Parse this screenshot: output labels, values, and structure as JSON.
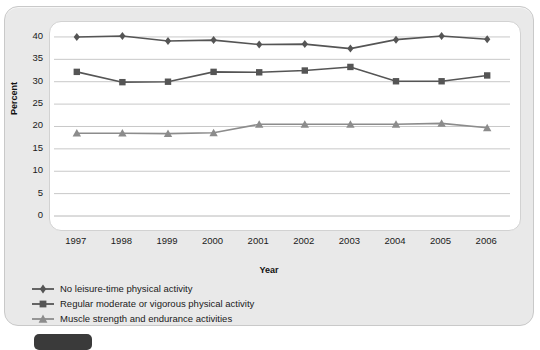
{
  "chart_data": {
    "type": "line",
    "title": "",
    "xlabel": "Year",
    "ylabel": "Percent",
    "categories": [
      "1997",
      "1998",
      "1999",
      "2000",
      "2001",
      "2002",
      "2003",
      "2004",
      "2005",
      "2006"
    ],
    "ylim": [
      0,
      42
    ],
    "yticks": [
      0,
      5,
      10,
      15,
      20,
      25,
      30,
      35,
      40
    ],
    "grid": true,
    "legend_position": "below",
    "series": [
      {
        "name": "No leisure-time physical activity",
        "marker": "diamond",
        "color": "#555555",
        "values": [
          40.0,
          40.2,
          39.1,
          39.3,
          38.3,
          38.4,
          37.4,
          39.4,
          40.2,
          39.5
        ]
      },
      {
        "name": "Regular moderate or vigorous physical activity",
        "marker": "square",
        "color": "#555555",
        "values": [
          32.2,
          29.9,
          30.0,
          32.2,
          32.1,
          32.5,
          33.3,
          30.1,
          30.1,
          31.4
        ]
      },
      {
        "name": "Muscle strength and endurance activities",
        "marker": "triangle",
        "color": "#8c8c8c",
        "values": [
          18.5,
          18.5,
          18.4,
          18.6,
          20.5,
          20.5,
          20.5,
          20.5,
          20.7,
          19.7
        ]
      }
    ]
  },
  "axis": {
    "ylabel": "Percent",
    "xlabel": "Year",
    "yticks": [
      "40",
      "35",
      "30",
      "25",
      "20",
      "15",
      "10",
      "5",
      "0"
    ],
    "xticks": [
      "1997",
      "1998",
      "1999",
      "2000",
      "2001",
      "2002",
      "2003",
      "2004",
      "2005",
      "2006"
    ]
  },
  "legend": {
    "items": [
      {
        "label": "No leisure-time physical activity",
        "marker": "diamond-marker-icon"
      },
      {
        "label": "Regular moderate or vigorous physical activity",
        "marker": "square-marker-icon"
      },
      {
        "label": "Muscle strength and endurance activities",
        "marker": "triangle-marker-icon"
      }
    ]
  },
  "colors": {
    "dark_series": "#555555",
    "light_series": "#8c8c8c",
    "card_bg": "#e9e9e9",
    "plot_bg": "#ffffff",
    "grid": "#c8c8c8"
  }
}
